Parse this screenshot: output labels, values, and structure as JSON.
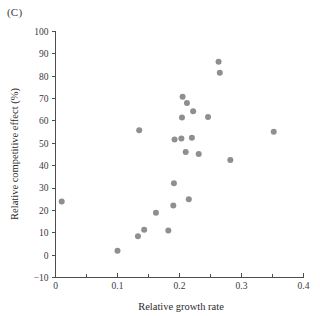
{
  "figure": {
    "panel_label": "(C)",
    "background_color": "#ffffff",
    "point_color": "#8f8f8f",
    "axis_color": "#4d4d4d"
  },
  "chart_data": {
    "type": "scatter",
    "title": "",
    "panel": "(C)",
    "xlabel": "Relative growth rate",
    "ylabel": "Relative competitive effect (%)",
    "xlim": [
      0,
      0.4
    ],
    "ylim": [
      -10,
      100
    ],
    "xticks": [
      0,
      0.1,
      0.2,
      0.3,
      0.4
    ],
    "xtick_labels": [
      "0",
      "0.1",
      "0.2",
      "0.3",
      "0.4"
    ],
    "xticks_minor": [
      0.05,
      0.15,
      0.25,
      0.35
    ],
    "yticks": [
      -10,
      0,
      10,
      20,
      30,
      40,
      50,
      60,
      70,
      80,
      90,
      100
    ],
    "ytick_labels": [
      "−10",
      "0",
      "10",
      "20",
      "30",
      "40",
      "50",
      "60",
      "70",
      "80",
      "90",
      "100"
    ],
    "grid": false,
    "legend": null,
    "marker": "circle",
    "marker_size": 3,
    "points": [
      {
        "x": 0.01,
        "y": 24.0
      },
      {
        "x": 0.1,
        "y": 2.0
      },
      {
        "x": 0.133,
        "y": 8.5
      },
      {
        "x": 0.135,
        "y": 55.8
      },
      {
        "x": 0.143,
        "y": 11.4
      },
      {
        "x": 0.162,
        "y": 19.0
      },
      {
        "x": 0.182,
        "y": 11.0
      },
      {
        "x": 0.19,
        "y": 22.2
      },
      {
        "x": 0.191,
        "y": 32.2
      },
      {
        "x": 0.192,
        "y": 51.7
      },
      {
        "x": 0.203,
        "y": 52.2
      },
      {
        "x": 0.204,
        "y": 61.5
      },
      {
        "x": 0.205,
        "y": 70.8
      },
      {
        "x": 0.21,
        "y": 46.1
      },
      {
        "x": 0.212,
        "y": 68.0
      },
      {
        "x": 0.215,
        "y": 25.0
      },
      {
        "x": 0.22,
        "y": 52.5
      },
      {
        "x": 0.222,
        "y": 64.3
      },
      {
        "x": 0.231,
        "y": 45.2
      },
      {
        "x": 0.246,
        "y": 61.8
      },
      {
        "x": 0.263,
        "y": 86.5
      },
      {
        "x": 0.265,
        "y": 81.5
      },
      {
        "x": 0.282,
        "y": 42.5
      },
      {
        "x": 0.352,
        "y": 55.2
      }
    ]
  }
}
